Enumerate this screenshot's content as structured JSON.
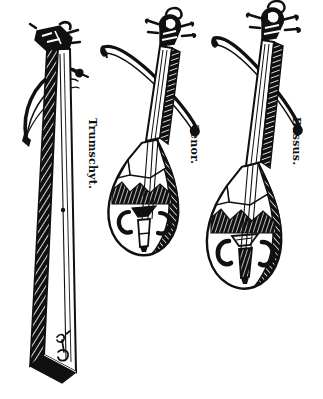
{
  "plate": {
    "title": "Trumschyt, Tenor and Bassus bowed instruments",
    "background_color": "#ffffff",
    "ink_color": "#101010",
    "style": "woodcut line engraving",
    "width": 323,
    "height": 399
  },
  "labels": {
    "trumschyt": "Trumschyt.",
    "tenor": "Tenor.",
    "bassus": "Bassus."
  },
  "figures": [
    {
      "name": "trumschyt",
      "label": "Trumschyt.",
      "description": "Long tapering three-sided trumpet marine with pegbox at top and curved bow",
      "parts": [
        "pegbox",
        "tapering-body",
        "hatched-shading",
        "bow",
        "soundhole-mark"
      ]
    },
    {
      "name": "tenor",
      "label": "Tenor.",
      "description": "Pear-shaped bowed lute with ornate scroll pegbox, two C-shaped soundholes, bridge and tailpiece",
      "parts": [
        "scroll-pegbox",
        "tuning-pegs",
        "neck",
        "pear-body",
        "c-soundhole-left",
        "c-soundhole-right",
        "bridge",
        "tailpiece",
        "bow"
      ]
    },
    {
      "name": "bassus",
      "label": "Bassus.",
      "description": "Larger pear-shaped bowed lute with ornate scroll pegbox, two C-shaped soundholes, bridge and tailpiece",
      "parts": [
        "scroll-pegbox",
        "tuning-pegs",
        "neck",
        "pear-body",
        "c-soundhole-left",
        "c-soundhole-right",
        "bridge",
        "tailpiece",
        "bow"
      ]
    }
  ]
}
